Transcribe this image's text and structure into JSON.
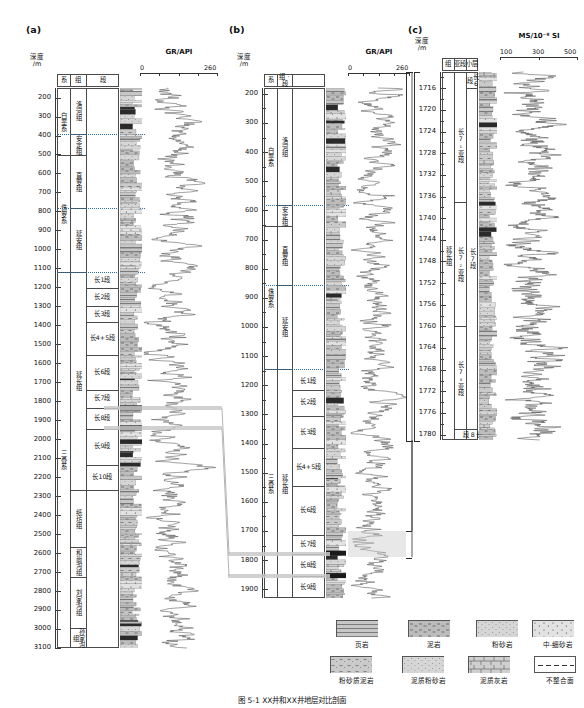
{
  "figure": {
    "caption": "图 5-1  XX井和XX井地层对比剖面",
    "panels": [
      "(a)",
      "(b)",
      "(c)"
    ]
  },
  "panel_a": {
    "label": "(a)",
    "headers": {
      "depth": "深度/m",
      "depth_l1": "深度",
      "depth_l2": "/m",
      "system": "系",
      "group": "组",
      "member": "段",
      "lithology": "岩性"
    },
    "track": {
      "title": "GR/API",
      "min": "0",
      "max": "260",
      "ticks": [
        "0",
        "260"
      ]
    },
    "depth_axis": {
      "top": 150,
      "bottom": 3100,
      "step": 100,
      "labels": [
        "200",
        "300",
        "400",
        "500",
        "600",
        "700",
        "800",
        "900",
        "1000",
        "1100",
        "1200",
        "1300",
        "1400",
        "1500",
        "1600",
        "1700",
        "1800",
        "1900",
        "2000",
        "2100",
        "2200",
        "2300",
        "2400",
        "2500",
        "2600",
        "2700",
        "2800",
        "2900",
        "3000",
        "3100"
      ]
    },
    "systems": [
      {
        "name": "白垩系",
        "top": 150,
        "base": 505
      },
      {
        "name": "侏罗系",
        "top": 505,
        "base": 1120
      },
      {
        "name": "三叠系",
        "top": 1120,
        "base": 3100
      }
    ],
    "groups": [
      {
        "name": "洛河组",
        "top": 150,
        "base": 390
      },
      {
        "name": "安定组",
        "top": 390,
        "base": 505
      },
      {
        "name": "直罗组",
        "top": 505,
        "base": 780
      },
      {
        "name": "延安组",
        "top": 780,
        "base": 1120
      },
      {
        "name": "延长组",
        "top": 1120,
        "base": 2270
      },
      {
        "name": "纸坊组",
        "top": 2270,
        "base": 2570
      },
      {
        "name": "和尚沟组",
        "top": 2570,
        "base": 2725
      },
      {
        "name": "刘家沟组",
        "top": 2725,
        "base": 2995
      },
      {
        "name": "孙家沟组",
        "top": 2995,
        "base": 3100
      }
    ],
    "members": [
      {
        "name": "长1段",
        "top": 1120,
        "base": 1205
      },
      {
        "name": "长2段",
        "top": 1205,
        "base": 1300
      },
      {
        "name": "长3段",
        "top": 1300,
        "base": 1385
      },
      {
        "name": "长4+5段",
        "top": 1385,
        "base": 1555
      },
      {
        "name": "长6段",
        "top": 1555,
        "base": 1740
      },
      {
        "name": "长7段",
        "top": 1740,
        "base": 1835
      },
      {
        "name": "长8段",
        "top": 1835,
        "base": 1945
      },
      {
        "name": "长9段",
        "top": 1945,
        "base": 2135
      },
      {
        "name": "长10段",
        "top": 2135,
        "base": 2270
      }
    ],
    "unconformities": [
      390,
      780,
      1120
    ],
    "correlation_markers": [
      1838,
      1943
    ]
  },
  "panel_b": {
    "label": "(b)",
    "headers": {
      "depth_l1": "深度",
      "depth_l2": "/m",
      "system": "系",
      "group_member": "组 · 段",
      "lithology": "岩性"
    },
    "track": {
      "title": "GR/API",
      "min": "0",
      "max": "260",
      "ticks": [
        "0",
        "260"
      ]
    },
    "depth_axis": {
      "top": 180,
      "bottom": 1930,
      "step": 50,
      "labels": [
        "200",
        "300",
        "400",
        "500",
        "600",
        "700",
        "800",
        "900",
        "1000",
        "1100",
        "1200",
        "1300",
        "1400",
        "1500",
        "1600",
        "1700",
        "1800",
        "1900"
      ]
    },
    "systems": [
      {
        "name": "白垩系",
        "top": 180,
        "base": 655
      },
      {
        "name": "侏罗系",
        "top": 655,
        "base": 1145
      },
      {
        "name": "三叠系",
        "top": 1145,
        "base": 1930
      }
    ],
    "groups": [
      {
        "name": "洛河组",
        "top": 180,
        "base": 583
      },
      {
        "name": "安定组",
        "top": 583,
        "base": 655
      },
      {
        "name": "直罗组",
        "top": 655,
        "base": 855
      },
      {
        "name": "延安组",
        "top": 855,
        "base": 1145
      },
      {
        "name": "延长组",
        "top": 1145,
        "base": 1930
      }
    ],
    "members": [
      {
        "name": "长1段",
        "top": 1160,
        "base": 1215
      },
      {
        "name": "长2段",
        "top": 1215,
        "base": 1305
      },
      {
        "name": "长3段",
        "top": 1305,
        "base": 1415
      },
      {
        "name": "长4+5段",
        "top": 1415,
        "base": 1545
      },
      {
        "name": "长6段",
        "top": 1545,
        "base": 1715
      },
      {
        "name": "长7段",
        "top": 1715,
        "base": 1780
      },
      {
        "name": "长8段",
        "top": 1780,
        "base": 1855
      },
      {
        "name": "长9段",
        "top": 1855,
        "base": 1930
      }
    ],
    "unconformities": [
      583,
      855,
      1145
    ],
    "correlation_markers": [
      1778,
      1855
    ],
    "zoom_highlight": {
      "top": 1700,
      "base": 1790
    }
  },
  "panel_c": {
    "label": "(c)",
    "headers": {
      "depth_l1": "深度",
      "depth_l2": "/m",
      "group": "组",
      "submember": "亚段",
      "layer": "小层",
      "lithology": "岩性"
    },
    "track": {
      "title": "MS/10⁻⁸ SI",
      "ticks": [
        "100",
        "300",
        "500"
      ]
    },
    "depth_axis": {
      "top": 1713,
      "bottom": 1781,
      "step": 2,
      "labels": [
        "1716",
        "1720",
        "1724",
        "1728",
        "1732",
        "1736",
        "1740",
        "1744",
        "1748",
        "1752",
        "1756",
        "1760",
        "1764",
        "1768",
        "1772",
        "1776",
        "1780"
      ]
    },
    "groups": [
      {
        "name": "延长组",
        "top": 1713,
        "base": 1781
      }
    ],
    "members": [
      {
        "name": "长6段",
        "top": 1713,
        "base": 1716
      },
      {
        "name": "长7段",
        "top": 1716,
        "base": 1779
      },
      {
        "name": "长8段",
        "top": 1779,
        "base": 1781
      }
    ],
    "submembers": [
      {
        "name": "长7₁亚段",
        "top": 1716,
        "base": 1737
      },
      {
        "name": "长7₂亚段",
        "top": 1737,
        "base": 1760
      },
      {
        "name": "长7₃亚段",
        "top": 1760,
        "base": 1779
      }
    ]
  },
  "legend": {
    "items": [
      {
        "name": "页岩",
        "pattern": "shale"
      },
      {
        "name": "泥岩",
        "pattern": "mudstone"
      },
      {
        "name": "粉砂岩",
        "pattern": "siltstone"
      },
      {
        "name": "中-细砂岩",
        "pattern": "med-fine-sandstone"
      },
      {
        "name": "粉砂质泥岩",
        "pattern": "silty-mudstone"
      },
      {
        "name": "泥质粉砂岩",
        "pattern": "muddy-siltstone"
      },
      {
        "name": "泥质灰岩",
        "pattern": "muddy-limestone"
      },
      {
        "name": "不整合面",
        "pattern": "unconformity"
      }
    ]
  },
  "chart_data": {
    "type": "line",
    "charts": [
      {
        "panel": "(a)",
        "curve": "GR",
        "xlabel": "GR/API",
        "xlim": [
          0,
          260
        ],
        "ylabel": "深度/m",
        "ylim": [
          150,
          3100
        ],
        "n_points": 420,
        "note": "Gamma-ray log, increases downward through Yanchang Fm"
      },
      {
        "panel": "(b)",
        "curve": "GR",
        "xlabel": "GR/API",
        "xlim": [
          0,
          260
        ],
        "ylabel": "深度/m",
        "ylim": [
          180,
          1930
        ],
        "n_points": 360,
        "note": "Gamma-ray log with high spike at 长7段 (~1730 m)"
      },
      {
        "panel": "(c)",
        "curve": "MS",
        "xlabel": "MS/10⁻⁸ SI",
        "xlim": [
          100,
          500
        ],
        "ylabel": "深度/m",
        "ylim": [
          1713,
          1781
        ],
        "n_points": 300,
        "note": "Magnetic susceptibility log across 长7 submembers"
      }
    ]
  }
}
